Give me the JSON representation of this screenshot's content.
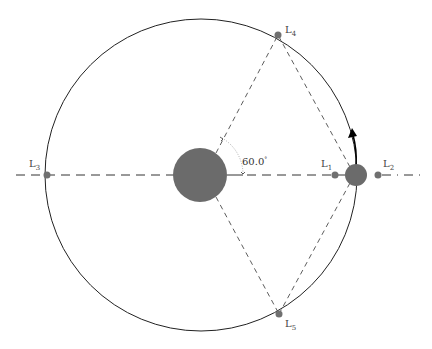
{
  "diagram": {
    "colors": {
      "background": "#ffffff",
      "orbit": "#222222",
      "body": "#6b6b6b",
      "point": "#707070",
      "dash": "#333333",
      "arrow": "#000000"
    },
    "primary": {
      "name": "central-body"
    },
    "secondary": {
      "name": "orbiting-body"
    },
    "angle_label": "60.0",
    "angle_unit": "°",
    "points": [
      {
        "id": "L1",
        "base": "L",
        "sub": "1"
      },
      {
        "id": "L2",
        "base": "L",
        "sub": "2"
      },
      {
        "id": "L3",
        "base": "L",
        "sub": "3"
      },
      {
        "id": "L4",
        "base": "L",
        "sub": "4"
      },
      {
        "id": "L5",
        "base": "L",
        "sub": "5"
      }
    ]
  }
}
